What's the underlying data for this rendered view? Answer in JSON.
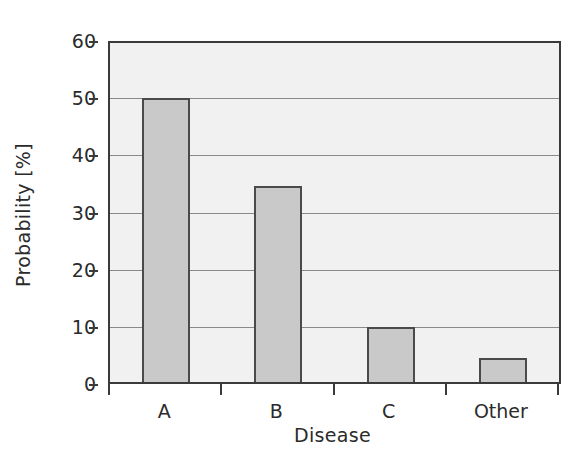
{
  "chart_data": {
    "type": "bar",
    "title": "",
    "subtitle": "",
    "categories": [
      "A",
      "B",
      "C",
      "Other"
    ],
    "values": [
      50,
      34.7,
      10,
      4.5
    ],
    "series": [
      {
        "name": "Probability",
        "values": [
          50,
          34.7,
          10,
          4.5
        ]
      }
    ],
    "xlabel": "Disease",
    "ylabel": "Probability [%]",
    "ylim": [
      0,
      60
    ],
    "yticks": [
      0,
      10,
      20,
      30,
      40,
      50,
      60
    ],
    "ytick_labels": [
      "0",
      "10",
      "20",
      "30",
      "40",
      "50",
      "60"
    ],
    "xtick_labels": [
      "A",
      "B",
      "C",
      "Other"
    ],
    "grid": "horizontal",
    "legend": "none",
    "annotations": [],
    "colors": {
      "bar_fill": "#c9c9c9",
      "bar_edge": "#4a4a4a",
      "plot_background": "#f1f1f1",
      "gridline": "#8a8a8a",
      "axis": "#3a3a3a",
      "text": "#2b2b2b",
      "figure_background": "#ffffff"
    }
  }
}
